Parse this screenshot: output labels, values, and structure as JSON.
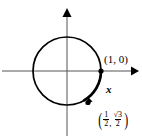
{
  "figure": {
    "kind": "unit-circle-diagram",
    "background_color": "#ffffff",
    "stroke_color": "#000000",
    "axis_color": "#555555"
  },
  "geometry": {
    "center_x": 67,
    "center_y": 71,
    "radius": 34,
    "x_axis_y": 71,
    "y_axis_x": 67,
    "x_axis_arrow_x": 133,
    "y_axis_arrow_y": 12,
    "point_1_0": {
      "x": 101,
      "y": 71
    },
    "point_terminal": {
      "x": 93,
      "y": 102
    },
    "arc_arrow": {
      "x": 92,
      "y": 103
    }
  },
  "labels": {
    "point_1_0": "(1, 0)",
    "arc_length": "x",
    "terminal_point": {
      "open_paren": "(",
      "first_numerator": "1",
      "first_denominator": "2",
      "comma": ",",
      "second_numerator": "√3",
      "second_denominator": "2",
      "close_paren": ")",
      "plain_text": "(1/2, √3/2)"
    }
  }
}
